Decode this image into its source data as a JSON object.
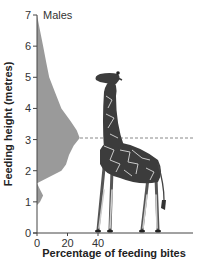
{
  "chart_data": {
    "type": "area",
    "orientation": "horizontal-distribution",
    "title": "",
    "series_label": "Males",
    "xlabel": "Percentage of feeding bites",
    "ylabel": "Feeding height (metres)",
    "xlim": [
      0,
      40
    ],
    "ylim": [
      0,
      7
    ],
    "x_ticks": [
      "0",
      "20",
      "40"
    ],
    "y_ticks": [
      "0",
      "1",
      "2",
      "3",
      "4",
      "5",
      "6",
      "7"
    ],
    "grid": false,
    "legend": "none",
    "fill_color": "#9a9a9a",
    "reference_line": {
      "y": 3.05,
      "style": "dashed",
      "color": "#888888",
      "description": "Dashed line at peak feeding height, aligned with giraffe neck"
    },
    "illustration": "giraffe standing on x-axis",
    "series": [
      {
        "name": "Males",
        "points": [
          {
            "height": 7.0,
            "percent": 0
          },
          {
            "height": 6.5,
            "percent": 2
          },
          {
            "height": 6.0,
            "percent": 4
          },
          {
            "height": 5.5,
            "percent": 6
          },
          {
            "height": 5.0,
            "percent": 8
          },
          {
            "height": 4.5,
            "percent": 12
          },
          {
            "height": 4.0,
            "percent": 16
          },
          {
            "height": 3.6,
            "percent": 22
          },
          {
            "height": 3.3,
            "percent": 26
          },
          {
            "height": 3.05,
            "percent": 28
          },
          {
            "height": 2.8,
            "percent": 24
          },
          {
            "height": 2.5,
            "percent": 21
          },
          {
            "height": 2.2,
            "percent": 19
          },
          {
            "height": 2.0,
            "percent": 16
          },
          {
            "height": 1.8,
            "percent": 8
          },
          {
            "height": 1.6,
            "percent": 0
          },
          {
            "height": 1.4,
            "percent": 2
          },
          {
            "height": 1.2,
            "percent": 4
          },
          {
            "height": 1.0,
            "percent": 2
          },
          {
            "height": 0.9,
            "percent": 0
          }
        ]
      }
    ]
  }
}
